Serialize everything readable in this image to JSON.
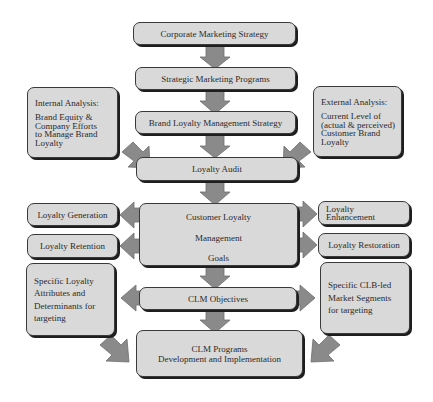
{
  "diagram": {
    "colors": {
      "box_fill": "#d9d9d9",
      "box_border": "#3a3a3a",
      "arrow_fill": "#8a8a8a",
      "arrow_stroke": "#6e6e6e",
      "background": "#ffffff"
    },
    "nodes": {
      "corporate": {
        "label": "Corporate Marketing Strategy"
      },
      "strategic": {
        "label": "Strategic Marketing Programs"
      },
      "brand_loyalty": {
        "label": "Brand Loyalty Management Strategy"
      },
      "internal": {
        "title": "Internal Analysis:",
        "body": "Brand Equity &\nCompany Efforts\nto Manage Brand\nLoyalty"
      },
      "external": {
        "title": "External Analysis:",
        "body": "Current Level of\n(actual & perceived)\nCustomer Brand\nLoyalty"
      },
      "audit": {
        "label": "Loyalty Audit"
      },
      "goals": {
        "line1": "Customer Loyalty",
        "line2": "Management",
        "line3": "Goals"
      },
      "generation": {
        "label": "Loyalty Generation"
      },
      "retention": {
        "label": "Loyalty Retention"
      },
      "enhancement": {
        "label": "Loyalty\nEnhancement"
      },
      "restoration": {
        "label": "Loyalty Restoration"
      },
      "attributes": {
        "label": "Specific Loyalty\nAttributes and\nDeterminants for\ntargeting"
      },
      "segments": {
        "label": "Specific CLB-led\nMarket Segments\nfor targeting"
      },
      "objectives": {
        "label": "CLM Objectives"
      },
      "programs": {
        "line1": "CLM Programs",
        "line2": "Development and Implementation"
      }
    },
    "edges": [
      {
        "from": "corporate",
        "to": "strategic",
        "direction": "down"
      },
      {
        "from": "strategic",
        "to": "brand_loyalty",
        "direction": "down"
      },
      {
        "from": "brand_loyalty",
        "to": "audit",
        "direction": "down"
      },
      {
        "from": "internal",
        "to": "audit",
        "direction": "diagonal"
      },
      {
        "from": "external",
        "to": "audit",
        "direction": "diagonal"
      },
      {
        "from": "audit",
        "to": "goals",
        "direction": "down"
      },
      {
        "from": "goals",
        "to": "generation",
        "direction": "left"
      },
      {
        "from": "goals",
        "to": "retention",
        "direction": "left"
      },
      {
        "from": "goals",
        "to": "enhancement",
        "direction": "right"
      },
      {
        "from": "goals",
        "to": "restoration",
        "direction": "right"
      },
      {
        "from": "goals",
        "to": "objectives",
        "direction": "down"
      },
      {
        "from": "objectives",
        "to": "attributes",
        "direction": "left"
      },
      {
        "from": "objectives",
        "to": "segments",
        "direction": "right"
      },
      {
        "from": "objectives",
        "to": "programs",
        "direction": "down"
      },
      {
        "from": "attributes",
        "to": "programs",
        "direction": "diagonal"
      },
      {
        "from": "segments",
        "to": "programs",
        "direction": "diagonal"
      }
    ]
  }
}
